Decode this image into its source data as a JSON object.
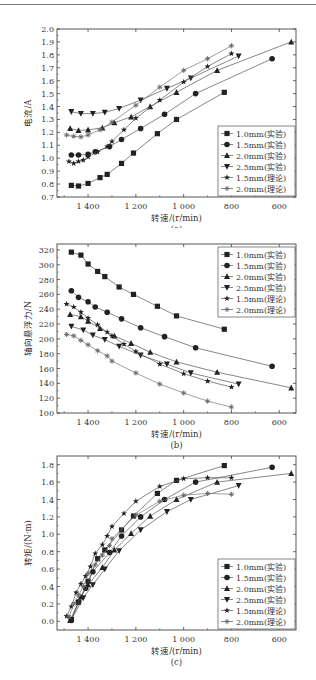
{
  "legend": [
    {
      "label": "1.0mm(实验)",
      "marker": "square"
    },
    {
      "label": "1.5mm(实验)",
      "marker": "circle"
    },
    {
      "label": "2.0mm(实验)",
      "marker": "triangle-up"
    },
    {
      "label": "2.5mm(实验)",
      "marker": "triangle-down"
    },
    {
      "label": "1.5mm(理论)",
      "marker": "star"
    },
    {
      "label": "2.0mm(理论)",
      "marker": "asterisk"
    }
  ],
  "chart_data": [
    {
      "id": "a",
      "type": "line",
      "title": "",
      "caption": "(a)",
      "xlabel": "转速/(r/min)",
      "ylabel": "电流/A",
      "xlim": [
        1530,
        530
      ],
      "ylim": [
        0.7,
        2.0
      ],
      "x_ticks": [
        1400,
        1200,
        1000,
        800,
        600
      ],
      "x_tick_labels": [
        "1 400",
        "1 200",
        "1 000",
        "800",
        "600"
      ],
      "y_ticks": [
        0.7,
        0.8,
        0.9,
        1.0,
        1.1,
        1.2,
        1.3,
        1.4,
        1.5,
        1.6,
        1.7,
        1.8,
        1.9,
        2.0
      ],
      "y_tick_labels": [
        "0.7",
        "0.8",
        "0.9",
        "1.0",
        "1.1",
        "1.2",
        "1.3",
        "1.4",
        "1.5",
        "1.6",
        "1.7",
        "1.8",
        "1.9",
        "2.0"
      ],
      "legend_position": "lower right",
      "grid": false,
      "series": [
        {
          "name": "1.0mm(实验)",
          "marker": "square",
          "x": [
            1470,
            1440,
            1400,
            1350,
            1320,
            1260,
            1210,
            1110,
            1030,
            830
          ],
          "y": [
            0.79,
            0.785,
            0.805,
            0.85,
            0.875,
            0.96,
            1.04,
            1.19,
            1.3,
            1.51
          ]
        },
        {
          "name": "1.5mm(实验)",
          "marker": "circle",
          "x": [
            1470,
            1440,
            1400,
            1370,
            1310,
            1260,
            1180,
            1080,
            950,
            630
          ],
          "y": [
            1.025,
            1.025,
            1.03,
            1.05,
            1.09,
            1.145,
            1.23,
            1.34,
            1.5,
            1.77
          ]
        },
        {
          "name": "2.0mm(实验)",
          "marker": "triangle-up",
          "x": [
            1475,
            1440,
            1400,
            1340,
            1290,
            1220,
            1140,
            1030,
            860,
            550
          ],
          "y": [
            1.23,
            1.215,
            1.22,
            1.235,
            1.275,
            1.32,
            1.4,
            1.51,
            1.68,
            1.9
          ]
        },
        {
          "name": "2.5mm(实验)",
          "marker": "triangle-down",
          "x": [
            1470,
            1430,
            1380,
            1330,
            1270,
            1180,
            1070,
            970,
            770
          ],
          "y": [
            1.36,
            1.345,
            1.345,
            1.355,
            1.385,
            1.45,
            1.54,
            1.62,
            1.79
          ]
        },
        {
          "name": "1.5mm(理论)",
          "marker": "star",
          "x": [
            1480,
            1460,
            1440,
            1420,
            1400,
            1360,
            1320,
            1300,
            1250,
            1200,
            1100,
            1000,
            900,
            800
          ],
          "y": [
            0.975,
            0.96,
            0.975,
            0.985,
            1.01,
            1.05,
            1.09,
            1.13,
            1.22,
            1.31,
            1.45,
            1.59,
            1.71,
            1.81
          ]
        },
        {
          "name": "2.0mm(理论)",
          "marker": "asterisk",
          "x": [
            1490,
            1460,
            1430,
            1400,
            1350,
            1300,
            1200,
            1100,
            1000,
            900,
            800
          ],
          "y": [
            1.18,
            1.17,
            1.165,
            1.18,
            1.22,
            1.28,
            1.41,
            1.55,
            1.68,
            1.77,
            1.87
          ]
        }
      ]
    },
    {
      "id": "b",
      "type": "line",
      "title": "",
      "caption": "(b)",
      "xlabel": "转速/(r/min)",
      "ylabel": "轴向悬浮力/N",
      "xlim": [
        1530,
        530
      ],
      "ylim": [
        100,
        328
      ],
      "x_ticks": [
        1400,
        1200,
        1000,
        800,
        600
      ],
      "x_tick_labels": [
        "1 400",
        "1 200",
        "1 000",
        "800",
        "600"
      ],
      "y_ticks": [
        100,
        120,
        140,
        160,
        180,
        200,
        220,
        240,
        260,
        280,
        300,
        320
      ],
      "y_tick_labels": [
        "100",
        "120",
        "140",
        "160",
        "180",
        "200",
        "220",
        "240",
        "260",
        "280",
        "300",
        "320"
      ],
      "legend_position": "upper right",
      "grid": false,
      "series": [
        {
          "name": "1.0mm(实验)",
          "marker": "square",
          "x": [
            1470,
            1430,
            1400,
            1360,
            1330,
            1270,
            1210,
            1110,
            1030,
            830
          ],
          "y": [
            317,
            313,
            301,
            291,
            284,
            270,
            260,
            244,
            231,
            213
          ]
        },
        {
          "name": "1.5mm(实验)",
          "marker": "circle",
          "x": [
            1470,
            1440,
            1400,
            1370,
            1320,
            1260,
            1180,
            1080,
            950,
            630
          ],
          "y": [
            265,
            256,
            250,
            243,
            236,
            227,
            215,
            203,
            188,
            163
          ]
        },
        {
          "name": "2.0mm(实验)",
          "marker": "triangle-up",
          "x": [
            1475,
            1430,
            1400,
            1350,
            1290,
            1220,
            1140,
            1030,
            860,
            550
          ],
          "y": [
            233,
            230,
            224,
            214,
            204,
            194,
            182,
            169,
            155,
            134
          ]
        },
        {
          "name": "2.5mm(实验)",
          "marker": "triangle-down",
          "x": [
            1470,
            1420,
            1380,
            1330,
            1270,
            1180,
            1070,
            970,
            770
          ],
          "y": [
            217,
            212,
            205,
            199,
            190,
            178,
            166,
            154,
            139
          ]
        },
        {
          "name": "1.5mm(理论)",
          "marker": "star",
          "x": [
            1490,
            1460,
            1430,
            1400,
            1360,
            1320,
            1300,
            1250,
            1200,
            1100,
            1000,
            900,
            800
          ],
          "y": [
            247,
            243,
            236,
            228,
            219,
            209,
            204,
            193,
            183,
            166,
            153,
            143,
            135
          ]
        },
        {
          "name": "2.0mm(理论)",
          "marker": "asterisk",
          "x": [
            1490,
            1460,
            1430,
            1400,
            1360,
            1320,
            1300,
            1200,
            1100,
            1000,
            900,
            800
          ],
          "y": [
            206,
            204,
            198,
            192,
            184,
            177,
            170,
            154,
            139,
            127,
            116,
            108
          ]
        }
      ]
    },
    {
      "id": "c",
      "type": "line",
      "title": "",
      "caption": "(c)",
      "xlabel": "转速/(r/min)",
      "ylabel": "转矩/(N·m)",
      "xlim": [
        1530,
        530
      ],
      "ylim": [
        -0.1,
        1.9
      ],
      "x_ticks": [
        1400,
        1200,
        1000,
        800,
        600
      ],
      "x_tick_labels": [
        "1 400",
        "1 200",
        "1 000",
        "800",
        "600"
      ],
      "y_ticks": [
        0.0,
        0.2,
        0.4,
        0.6,
        0.8,
        1.0,
        1.2,
        1.4,
        1.6,
        1.8
      ],
      "y_tick_labels": [
        "0.0",
        "0.2",
        "0.4",
        "0.6",
        "0.8",
        "1.0",
        "1.2",
        "1.4",
        "1.6",
        "1.8"
      ],
      "legend_position": "lower right",
      "grid": false,
      "series": [
        {
          "name": "1.0mm(实验)",
          "marker": "square",
          "x": [
            1470,
            1440,
            1400,
            1360,
            1330,
            1260,
            1210,
            1110,
            1030,
            830
          ],
          "y": [
            0.02,
            0.22,
            0.46,
            0.72,
            0.82,
            1.05,
            1.21,
            1.47,
            1.62,
            1.79
          ]
        },
        {
          "name": "1.5mm(实验)",
          "marker": "circle",
          "x": [
            1470,
            1440,
            1410,
            1380,
            1310,
            1260,
            1180,
            1080,
            950,
            630
          ],
          "y": [
            0.01,
            0.22,
            0.38,
            0.57,
            0.79,
            0.98,
            1.2,
            1.4,
            1.6,
            1.77
          ]
        },
        {
          "name": "2.0mm(实验)",
          "marker": "triangle-up",
          "x": [
            1475,
            1430,
            1400,
            1340,
            1290,
            1220,
            1140,
            1030,
            860,
            550
          ],
          "y": [
            0.01,
            0.28,
            0.42,
            0.62,
            0.82,
            1.01,
            1.21,
            1.4,
            1.6,
            1.7
          ]
        },
        {
          "name": "2.5mm(实验)",
          "marker": "triangle-down",
          "x": [
            1470,
            1420,
            1380,
            1330,
            1270,
            1180,
            1070,
            970,
            770
          ],
          "y": [
            0.02,
            0.27,
            0.42,
            0.6,
            0.81,
            1.05,
            1.26,
            1.4,
            1.56
          ]
        },
        {
          "name": "1.5mm(理论)",
          "marker": "star",
          "x": [
            1490,
            1470,
            1450,
            1430,
            1410,
            1390,
            1370,
            1340,
            1320,
            1300,
            1250,
            1200,
            1100,
            1000,
            900,
            800
          ],
          "y": [
            0.06,
            0.17,
            0.33,
            0.43,
            0.52,
            0.63,
            0.78,
            0.88,
            0.98,
            1.09,
            1.24,
            1.38,
            1.55,
            1.64,
            1.65,
            1.65
          ]
        },
        {
          "name": "2.0mm(理论)",
          "marker": "asterisk",
          "x": [
            1480,
            1460,
            1440,
            1420,
            1400,
            1370,
            1340,
            1310,
            1300,
            1200,
            1100,
            1000,
            900,
            800
          ],
          "y": [
            0.05,
            0.2,
            0.3,
            0.4,
            0.55,
            0.65,
            0.76,
            0.87,
            0.95,
            1.22,
            1.38,
            1.45,
            1.47,
            1.46
          ]
        }
      ]
    }
  ]
}
